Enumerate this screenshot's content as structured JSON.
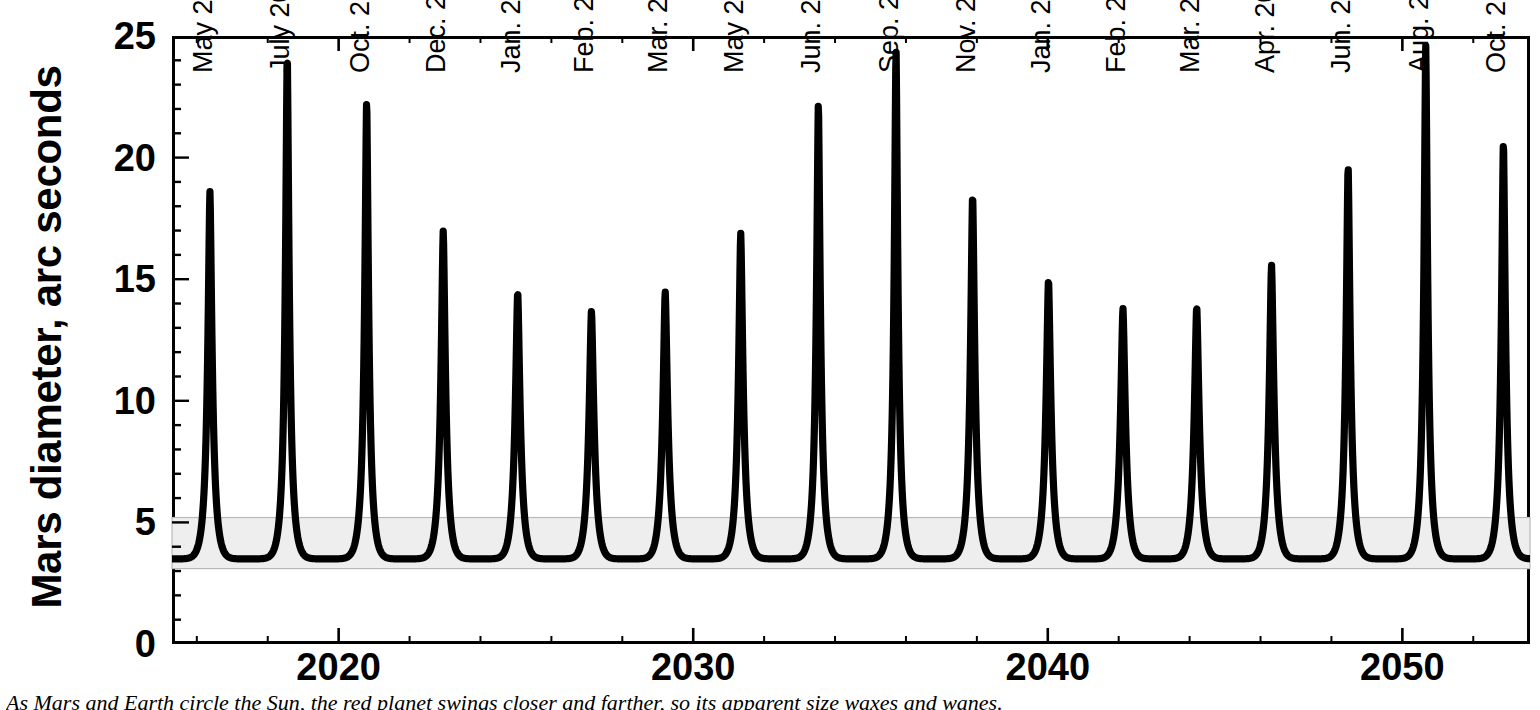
{
  "chart_data": {
    "type": "line",
    "title": "",
    "xlabel": "",
    "ylabel": "Mars diameter, arc seconds",
    "xlim": [
      2015.3,
      2053.6
    ],
    "ylim": [
      0,
      25
    ],
    "grid": false,
    "legend": "none",
    "y_ticks_major": [
      0,
      5,
      10,
      15,
      20,
      25
    ],
    "y_ticks_minor_step": 1,
    "x_ticks_major": [
      2020,
      2030,
      2040,
      2050
    ],
    "x_ticks_minor_step": 2,
    "shaded_band": {
      "label": "typical far-side diameter range",
      "y_min": 3.1,
      "y_max": 5.2,
      "color": "#eeeeee"
    },
    "series": [
      {
        "name": "Mars apparent diameter",
        "color": "#000000",
        "minimum_diameter": 3.5,
        "oppositions": [
          {
            "label": "May 2016",
            "x": 2016.37,
            "y": 18.6
          },
          {
            "label": "July 2018",
            "x": 2018.55,
            "y": 24.3
          },
          {
            "label": "Oct. 2020",
            "x": 2020.79,
            "y": 22.4
          },
          {
            "label": "Dec. 2022",
            "x": 2022.95,
            "y": 17.0
          },
          {
            "label": "Jan. 2025",
            "x": 2025.05,
            "y": 14.5
          },
          {
            "label": "Feb. 2027",
            "x": 2027.13,
            "y": 13.7
          },
          {
            "label": "Mar. 2029",
            "x": 2029.21,
            "y": 14.5
          },
          {
            "label": "May 2031",
            "x": 2031.34,
            "y": 16.9
          },
          {
            "label": "Jun. 2033",
            "x": 2033.53,
            "y": 22.3
          },
          {
            "label": "Sep. 2035",
            "x": 2035.72,
            "y": 24.5
          },
          {
            "label": "Nov. 2037",
            "x": 2037.88,
            "y": 18.5
          },
          {
            "label": "Jan. 2040",
            "x": 2040.02,
            "y": 15.0
          },
          {
            "label": "Feb. 2042",
            "x": 2042.12,
            "y": 13.8
          },
          {
            "label": "Mar. 2044",
            "x": 2044.2,
            "y": 13.9
          },
          {
            "label": "Apr. 2046",
            "x": 2046.31,
            "y": 15.6
          },
          {
            "label": "Jun. 2048",
            "x": 2048.47,
            "y": 19.7
          },
          {
            "label": "Aug. 2050",
            "x": 2050.66,
            "y": 24.6
          },
          {
            "label": "Oct. 2052",
            "x": 2052.85,
            "y": 20.7
          }
        ]
      }
    ]
  },
  "axes": {
    "y_title": "Mars diameter, arc seconds",
    "y_tick_labels": [
      "25",
      "20",
      "15",
      "10",
      "5",
      "0"
    ],
    "x_tick_labels": [
      "2020",
      "2030",
      "2040",
      "2050"
    ]
  },
  "caption": {
    "text": "As Mars and Earth circle the Sun, the red planet swings closer and farther, so its apparent size waxes and wanes."
  }
}
